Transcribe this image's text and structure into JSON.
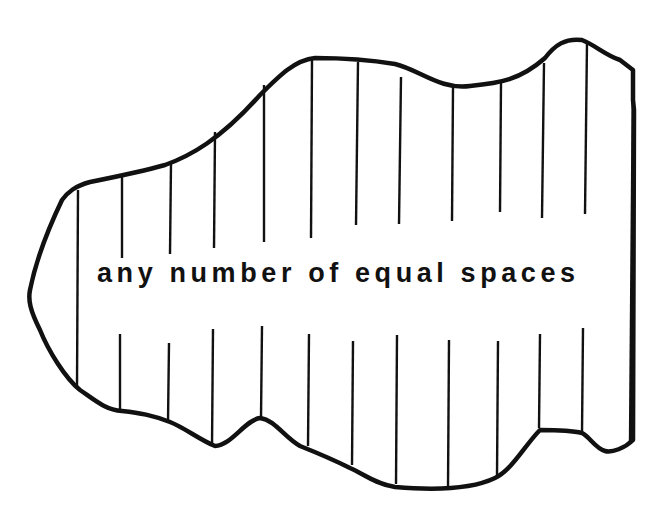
{
  "diagram": {
    "caption": "any number of equal spaces",
    "stroke_color": "#111111",
    "background": "#ffffff",
    "divider_count": 13
  }
}
